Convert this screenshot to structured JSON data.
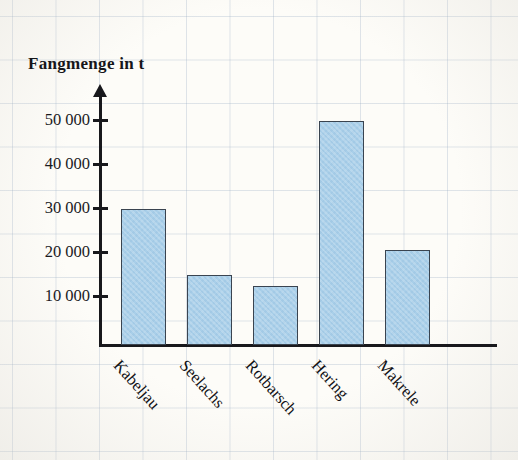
{
  "chart_data": {
    "type": "bar",
    "title": "Fangmenge in t",
    "xlabel": "",
    "ylabel": "Fangmenge in t",
    "categories": [
      "Kabeljau",
      "Seelachs",
      "Rotbarsch",
      "Hering",
      "Makrele"
    ],
    "values": [
      31000,
      16000,
      13500,
      51000,
      21500
    ],
    "ylim": [
      0,
      55000
    ],
    "ytick_values": [
      10000,
      20000,
      30000,
      40000,
      50000
    ],
    "ytick_labels": [
      "10 000",
      "20 000",
      "30 000",
      "40 000",
      "50 000"
    ],
    "grid": true,
    "legend": null,
    "bar_color": "#a9cfe9",
    "bar_edge_color": "#3a4450",
    "axis_color": "#18181c"
  },
  "axis": {
    "title": "Fangmenge in t"
  },
  "ticks": [
    {
      "label": "50 000"
    },
    {
      "label": "40 000"
    },
    {
      "label": "30 000"
    },
    {
      "label": "20 000"
    },
    {
      "label": "10 000"
    }
  ],
  "bars": [
    {
      "label": "Kabeljau"
    },
    {
      "label": "Seelachs"
    },
    {
      "label": "Rotbarsch"
    },
    {
      "label": "Hering"
    },
    {
      "label": "Makrele"
    }
  ]
}
